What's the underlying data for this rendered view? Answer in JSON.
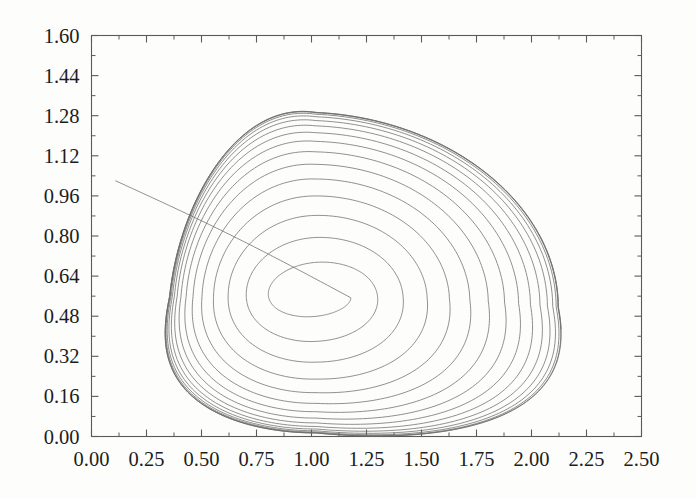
{
  "figure": {
    "kind": "phase-portrait",
    "background_color": "#fdfdfc",
    "frame_color": "#5a5a5a",
    "curve_color": "#6b6b6b"
  },
  "chart_data": {
    "type": "line",
    "title": "",
    "subtitle": "",
    "xlabel": "",
    "ylabel": "",
    "grid": false,
    "legend": "none",
    "xlim": [
      0.0,
      2.5
    ],
    "ylim": [
      0.0,
      1.6
    ],
    "x_ticks": [
      0.0,
      0.25,
      0.5,
      0.75,
      1.0,
      1.25,
      1.5,
      1.75,
      2.0,
      2.25,
      2.5
    ],
    "x_tick_labels": [
      "0.00",
      "0.25",
      "0.50",
      "0.75",
      "1.00",
      "1.25",
      "1.50",
      "1.75",
      "2.00",
      "2.25",
      "2.50"
    ],
    "y_ticks": [
      0.0,
      0.16,
      0.32,
      0.48,
      0.64,
      0.8,
      0.96,
      1.12,
      1.28,
      1.44,
      1.6
    ],
    "y_tick_labels": [
      "0.00",
      "0.16",
      "0.32",
      "0.48",
      "0.64",
      "0.80",
      "0.96",
      "1.12",
      "1.28",
      "1.44",
      "1.60"
    ],
    "x_minor_per_major": 2,
    "y_minor_per_major": 2,
    "annotations": [],
    "series": [
      {
        "name": "trajectory",
        "description": "outward-spiralling orbit approaching a limit cycle",
        "start_point": [
          0.11,
          1.02
        ],
        "spiral_center": [
          1.02,
          0.56
        ],
        "turns": 15,
        "inner_rx": 0.16,
        "inner_ry": 0.055,
        "outer_rx": 0.95,
        "outer_ry": 0.78,
        "outer_extent_x": [
          0.18,
          2.13
        ],
        "outer_extent_y": [
          0.01,
          1.49
        ]
      }
    ]
  }
}
